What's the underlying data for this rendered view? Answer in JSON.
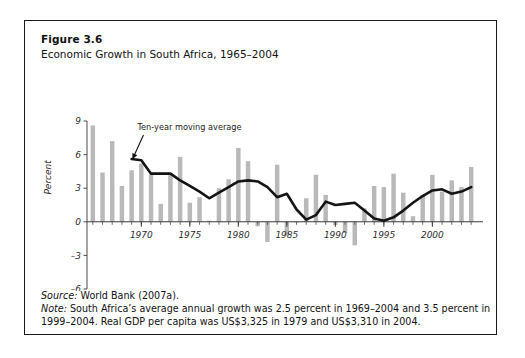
{
  "figure": {
    "number": "Figure 3.6",
    "title": "Economic Growth in South Africa, 1965–2004"
  },
  "notes": {
    "source_lead": "Source:",
    "source_text": " World Bank (2007a).",
    "note_lead": "Note:",
    "note_line1": " South Africa’s average annual growth was 2.5 percent in 1969–2004 and 3.5 percent in",
    "note_line2": "1999–2004. Real GDP per capita was US$3,325 in 1979 and US$3,310 in 2004."
  },
  "chart_data": {
    "type": "bar",
    "title": "Economic Growth in South Africa, 1965–2004",
    "subtitle": "",
    "xlabel": "",
    "ylabel": "Percent",
    "ylim": [
      -6,
      9
    ],
    "yticks": [
      9,
      6,
      3,
      0,
      -3,
      -6
    ],
    "ytick_labels": [
      "9",
      "6",
      "3",
      "0",
      "–3",
      "–6"
    ],
    "xlim": [
      1964.4,
      2004.6
    ],
    "xticks": [
      1970,
      1975,
      1980,
      1985,
      1990,
      1995,
      2000
    ],
    "xtick_labels": [
      "1970",
      "1975",
      "1980",
      "1985",
      "1990",
      "1995",
      "2000"
    ],
    "grid": false,
    "legend": "none",
    "bar_color": "#b9b9b9",
    "line_color": "#141414",
    "annotations": [
      {
        "text": "Ten-year moving average",
        "x": 1969.6,
        "y": 8.2,
        "arrow_to_x": 1969.1,
        "arrow_to_y": 5.6
      }
    ],
    "categories": [
      1965,
      1966,
      1967,
      1968,
      1969,
      1970,
      1971,
      1972,
      1973,
      1974,
      1975,
      1976,
      1977,
      1978,
      1979,
      1980,
      1981,
      1982,
      1983,
      1984,
      1985,
      1986,
      1987,
      1988,
      1989,
      1990,
      1991,
      1992,
      1993,
      1994,
      1995,
      1996,
      1997,
      1998,
      1999,
      2000,
      2001,
      2002,
      2003,
      2004
    ],
    "series": [
      {
        "name": "Annual GDP growth",
        "type": "bar",
        "values": [
          8.6,
          4.4,
          7.2,
          3.2,
          4.6,
          5.2,
          4.2,
          1.6,
          4.3,
          5.8,
          1.7,
          2.2,
          0.1,
          3.0,
          3.8,
          6.6,
          5.4,
          -0.4,
          -1.8,
          5.1,
          -1.2,
          0.0,
          2.1,
          4.2,
          2.4,
          -0.3,
          -1.0,
          -2.1,
          1.2,
          3.2,
          3.1,
          4.3,
          2.6,
          0.5,
          2.4,
          4.2,
          2.7,
          3.7,
          3.1,
          4.9
        ]
      },
      {
        "name": "Ten-year moving average",
        "type": "line",
        "x": [
          1969,
          1970,
          1971,
          1972,
          1973,
          1974,
          1975,
          1976,
          1977,
          1978,
          1979,
          1980,
          1981,
          1982,
          1983,
          1984,
          1985,
          1986,
          1987,
          1988,
          1989,
          1990,
          1991,
          1992,
          1993,
          1994,
          1995,
          1996,
          1997,
          1998,
          1999,
          2000,
          2001,
          2002,
          2003,
          2004
        ],
        "values": [
          5.6,
          5.5,
          4.3,
          4.3,
          4.3,
          3.7,
          3.2,
          2.7,
          2.1,
          2.6,
          3.1,
          3.6,
          3.7,
          3.6,
          3.1,
          2.2,
          2.5,
          1.1,
          0.2,
          0.6,
          1.8,
          1.5,
          1.6,
          1.7,
          1.0,
          0.3,
          0.1,
          0.4,
          1.0,
          1.7,
          2.3,
          2.8,
          2.9,
          2.5,
          2.7,
          3.1
        ]
      }
    ]
  }
}
